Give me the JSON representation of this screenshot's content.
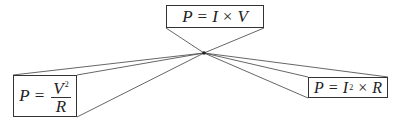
{
  "diagram": {
    "center_point": {
      "x": 204,
      "y": 53
    },
    "line_color": "#555555",
    "border_color": "#333333",
    "formulas": {
      "top": {
        "lhs": "P",
        "eq": "=",
        "a": "I",
        "op": "×",
        "b": "V",
        "text": "P = I × V"
      },
      "left": {
        "lhs": "P",
        "eq": "=",
        "numerator": "V",
        "numerator_exp": "2",
        "denominator": "R",
        "text": "P = V² / R"
      },
      "right": {
        "lhs": "P",
        "eq": "=",
        "a": "I",
        "a_exp": "2",
        "op": "×",
        "b": "R",
        "text": "P = I² × R"
      }
    }
  }
}
